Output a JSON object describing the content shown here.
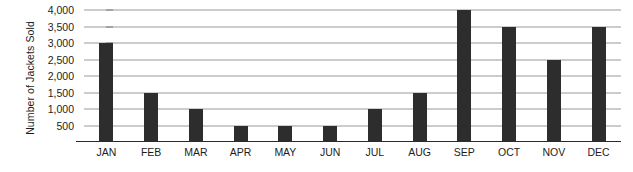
{
  "chart_data": {
    "type": "bar",
    "title": "",
    "xlabel": "",
    "ylabel": "Number of Jackets Sold",
    "categories": [
      "JAN",
      "FEB",
      "MAR",
      "APR",
      "MAY",
      "JUN",
      "JUL",
      "AUG",
      "SEP",
      "OCT",
      "NOV",
      "DEC"
    ],
    "values": [
      3000,
      1500,
      1000,
      500,
      500,
      500,
      1000,
      1500,
      4000,
      3500,
      2500,
      3500
    ],
    "ylim": [
      0,
      4000
    ],
    "yticks": [
      500,
      1000,
      1500,
      2000,
      2500,
      3000,
      3500,
      4000
    ],
    "ytick_labels": [
      "500",
      "1,000",
      "1,500",
      "2,000",
      "2,500",
      "3,000",
      "3,500",
      "4,000"
    ],
    "grid": true,
    "legend": false,
    "bar_color": "#2d2d2d",
    "gridline_color": "#9a9a9a",
    "axis_color": "#2b2b2b",
    "background_color": "#ffffff"
  }
}
